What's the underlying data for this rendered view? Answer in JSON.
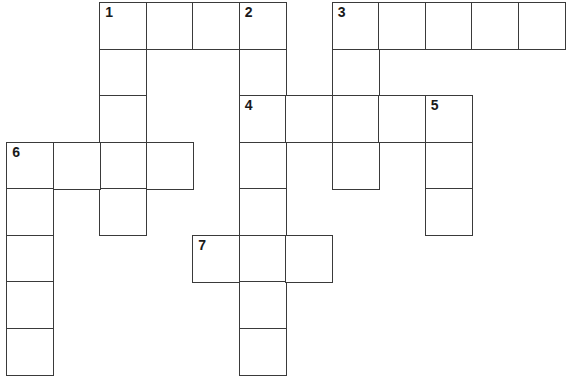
{
  "puzzle": {
    "type": "crossword",
    "columns": 12,
    "rows": 8,
    "line_color": "#3a3a3a",
    "background": "#ffffff",
    "entries": [
      {
        "number": "1",
        "direction": "across",
        "row": 0,
        "col": 2,
        "length": 4
      },
      {
        "number": "1",
        "direction": "down",
        "row": 0,
        "col": 2,
        "length": 5
      },
      {
        "number": "2",
        "direction": "down",
        "row": 0,
        "col": 5,
        "length": 8
      },
      {
        "number": "3",
        "direction": "across",
        "row": 0,
        "col": 7,
        "length": 5
      },
      {
        "number": "3",
        "direction": "down",
        "row": 0,
        "col": 7,
        "length": 4
      },
      {
        "number": "4",
        "direction": "across",
        "row": 2,
        "col": 5,
        "length": 5
      },
      {
        "number": "5",
        "direction": "down",
        "row": 2,
        "col": 9,
        "length": 3
      },
      {
        "number": "6",
        "direction": "across",
        "row": 3,
        "col": 0,
        "length": 4
      },
      {
        "number": "6",
        "direction": "down",
        "row": 3,
        "col": 0,
        "length": 5
      },
      {
        "number": "7",
        "direction": "across",
        "row": 5,
        "col": 4,
        "length": 3
      }
    ]
  }
}
